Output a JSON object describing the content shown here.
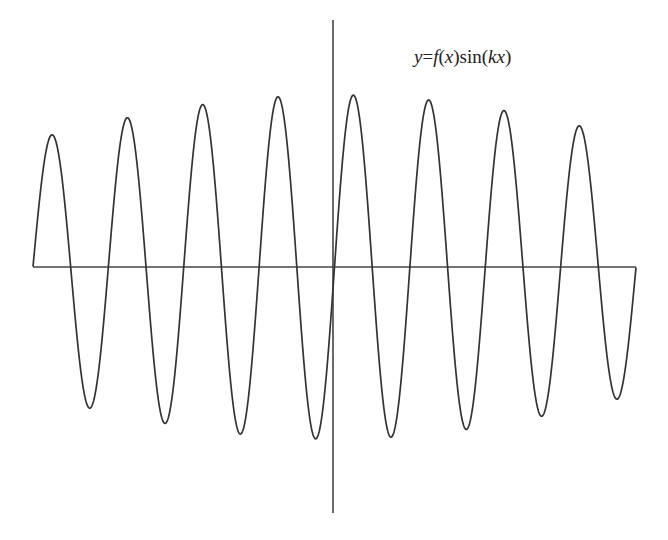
{
  "chart_data": {
    "type": "line",
    "title": "",
    "annotation": {
      "text": "y=f(x)sin(kx)",
      "parts": [
        {
          "t": "y",
          "italic": true
        },
        {
          "t": "=",
          "italic": false
        },
        {
          "t": "f",
          "italic": true
        },
        {
          "t": "(",
          "italic": false
        },
        {
          "t": "x",
          "italic": true
        },
        {
          "t": ")sin(",
          "italic": false
        },
        {
          "t": "kx",
          "italic": true
        },
        {
          "t": ")",
          "italic": false
        }
      ]
    },
    "xlabel": "",
    "ylabel": "",
    "grid": false,
    "legend": null,
    "axes": {
      "x_axis": {
        "from_px": 33,
        "to_px": 636,
        "y_px": 267
      },
      "y_axis": {
        "x_px": 333,
        "from_px": 20,
        "to_px": 513
      }
    },
    "function": {
      "expression": "y = f(x) * sin(k x)",
      "k": 1,
      "x_range": [
        -25.13,
        25.13
      ],
      "periods": 8,
      "envelope": "f(x) = exp(-0.3 * (x / 25.13)^2)",
      "envelope_peak": 1.0
    },
    "series": [
      {
        "name": "y=f(x)sin(kx)",
        "color": "#333333",
        "peaks_px": [
          [
            52,
            131
          ],
          [
            127,
            114
          ],
          [
            201,
            103
          ],
          [
            276,
            96
          ],
          [
            352,
            95
          ],
          [
            428,
            99
          ],
          [
            503,
            107
          ],
          [
            578,
            121
          ]
        ],
        "troughs_px": [
          [
            90,
            413
          ],
          [
            164,
            426
          ],
          [
            238,
            435
          ],
          [
            314,
            439
          ],
          [
            390,
            437
          ],
          [
            466,
            431
          ],
          [
            541,
            420
          ],
          [
            617,
            403
          ]
        ],
        "zero_crossings_px": [
          33,
          70,
          108,
          146,
          184,
          221,
          259,
          296,
          333,
          371,
          410,
          447,
          485,
          522,
          560,
          598,
          636
        ]
      }
    ]
  },
  "style": {
    "line_color": "#333333",
    "axis_color": "#444444",
    "background": "#ffffff"
  }
}
